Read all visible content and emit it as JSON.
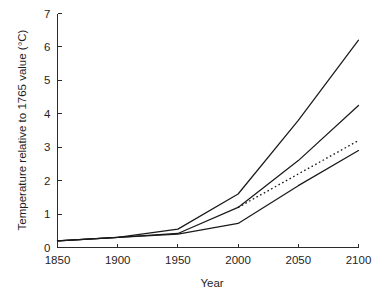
{
  "chart_data": {
    "type": "line",
    "title": "",
    "xlabel": "Year",
    "ylabel": "Temperature relative to 1765 value (°C)",
    "xlim": [
      1850,
      2100
    ],
    "ylim": [
      0,
      7
    ],
    "xticks": [
      1850,
      1900,
      1950,
      2000,
      2050,
      2100
    ],
    "xtick_labels": [
      "1850",
      "1900",
      "1950",
      "2000",
      "2050",
      "2100"
    ],
    "yticks": [
      0,
      1,
      2,
      3,
      4,
      5,
      6,
      7
    ],
    "ytick_labels": [
      "0",
      "1",
      "2",
      "3",
      "4",
      "5",
      "6",
      "7"
    ],
    "grid": false,
    "legend": false,
    "legend_position": "none",
    "x": [
      1850,
      1900,
      1950,
      2000,
      2050,
      2100
    ],
    "series": [
      {
        "name": "high-scenario",
        "style": "solid",
        "color": "#1a1a1a",
        "values": [
          0.2,
          0.3,
          0.55,
          1.6,
          3.8,
          6.2
        ]
      },
      {
        "name": "mid-high-scenario",
        "style": "solid",
        "color": "#1a1a1a",
        "values": [
          0.2,
          0.3,
          0.42,
          1.2,
          2.6,
          4.25
        ]
      },
      {
        "name": "mid-scenario-dashed",
        "style": "dashed",
        "color": "#1a1a1a",
        "x": [
          2000,
          2050,
          2100
        ],
        "values": [
          1.2,
          2.2,
          3.2
        ]
      },
      {
        "name": "low-scenario",
        "style": "solid",
        "color": "#1a1a1a",
        "values": [
          0.2,
          0.3,
          0.4,
          0.72,
          1.85,
          2.9
        ]
      }
    ]
  },
  "axes": {
    "y_title": "Temperature relative to 1765 value (°C)",
    "x_title": "Year"
  },
  "colors": {
    "line": "#1a1a1a",
    "axis": "#2b2b2b",
    "background": "#ffffff"
  }
}
